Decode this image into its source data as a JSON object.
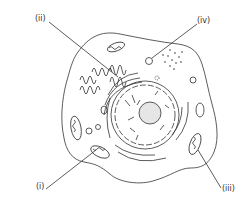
{
  "diagram": {
    "labels": [
      {
        "id": "i",
        "text": "(i)",
        "x": 38,
        "y": 185,
        "points_to": "mitochondrion"
      },
      {
        "id": "ii",
        "text": "(ii)",
        "x": 35,
        "y": 18,
        "points_to": "rough endoplasmic reticulum"
      },
      {
        "id": "iii",
        "text": "(iii)",
        "x": 222,
        "y": 188,
        "points_to": "mitochondrion"
      },
      {
        "id": "iv",
        "text": "(iv)",
        "x": 198,
        "y": 20,
        "points_to": "vesicle"
      }
    ],
    "colors": {
      "line": "#333333",
      "background": "#ffffff",
      "nucleolus": "#e6e6e6"
    }
  }
}
